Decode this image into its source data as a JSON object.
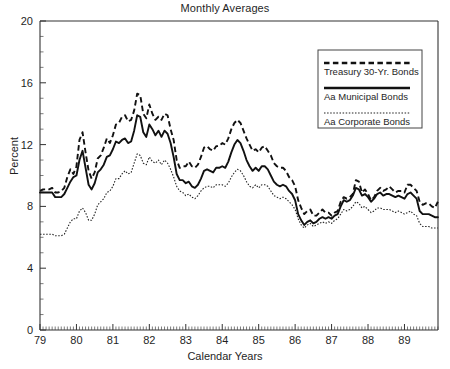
{
  "chart_data": {
    "type": "line",
    "title": "Monthly Averages",
    "xlabel": "Calendar Years",
    "ylabel": "Percent",
    "ylim": [
      0,
      20
    ],
    "yticks": [
      0,
      4,
      8,
      12,
      16,
      20
    ],
    "ytick_labels": [
      "0",
      "4",
      "8",
      "12",
      "16",
      "20"
    ],
    "xlim": [
      1979.0,
      1989.92
    ],
    "xticks": [
      1979,
      1980,
      1981,
      1982,
      1983,
      1984,
      1985,
      1986,
      1987,
      1988,
      1989
    ],
    "xtick_labels": [
      "79",
      "80",
      "81",
      "82",
      "83",
      "84",
      "85",
      "86",
      "87",
      "88",
      "89"
    ],
    "minor_ticks": "monthly",
    "grid": false,
    "legend_position": "upper-right",
    "series": [
      {
        "name": "Treasury 30-Yr. Bonds",
        "style": "dashed",
        "color": "#111111",
        "values": [
          9.0,
          9.1,
          9.1,
          9.1,
          9.2,
          8.9,
          8.9,
          9.0,
          9.2,
          9.9,
          10.4,
          10.1,
          10.6,
          12.3,
          12.8,
          11.5,
          10.3,
          9.8,
          10.2,
          11.1,
          11.3,
          11.8,
          12.4,
          12.1,
          12.6,
          13.3,
          13.4,
          13.8,
          13.9,
          13.5,
          13.6,
          14.2,
          15.3,
          15.2,
          14.0,
          13.7,
          14.6,
          14.0,
          13.6,
          13.8,
          13.6,
          14.0,
          13.9,
          13.0,
          12.3,
          11.0,
          10.5,
          10.6,
          10.6,
          10.9,
          10.6,
          10.5,
          10.7,
          11.2,
          11.8,
          11.9,
          11.7,
          11.6,
          11.9,
          11.9,
          12.1,
          12.0,
          12.4,
          13.0,
          13.4,
          13.6,
          13.4,
          12.9,
          12.4,
          12.0,
          11.6,
          11.7,
          11.5,
          11.8,
          11.9,
          11.6,
          11.3,
          10.8,
          10.6,
          10.5,
          10.5,
          10.3,
          9.9,
          9.7,
          9.3,
          8.4,
          7.9,
          7.5,
          7.7,
          7.8,
          7.4,
          7.4,
          7.6,
          7.8,
          7.6,
          7.6,
          7.4,
          7.6,
          7.7,
          8.3,
          8.6,
          8.5,
          8.6,
          8.8,
          9.7,
          9.6,
          8.9,
          9.1,
          8.8,
          8.4,
          8.6,
          9.0,
          9.2,
          9.0,
          9.1,
          9.3,
          9.1,
          8.9,
          9.0,
          9.0,
          8.9,
          9.4,
          9.4,
          9.2,
          9.0,
          8.3,
          8.1,
          8.2,
          8.2,
          8.0,
          7.9,
          8.3
        ]
      },
      {
        "name": "Aa Municipal Bonds",
        "style": "solid",
        "color": "#111111",
        "values": [
          8.9,
          8.9,
          8.9,
          8.9,
          8.9,
          8.6,
          8.6,
          8.6,
          8.8,
          9.2,
          9.6,
          9.9,
          10.0,
          11.0,
          11.6,
          10.5,
          9.4,
          9.1,
          9.5,
          10.2,
          10.4,
          10.7,
          11.2,
          11.3,
          11.7,
          12.2,
          12.1,
          12.3,
          12.4,
          12.1,
          12.2,
          12.9,
          13.9,
          13.8,
          12.8,
          12.5,
          13.3,
          13.0,
          12.6,
          12.9,
          12.5,
          12.9,
          12.7,
          12.1,
          11.2,
          10.1,
          9.7,
          9.7,
          9.5,
          9.6,
          9.3,
          9.2,
          9.4,
          9.8,
          10.3,
          10.4,
          10.3,
          10.2,
          10.5,
          10.5,
          10.6,
          10.5,
          10.9,
          11.5,
          12.0,
          12.3,
          12.1,
          11.6,
          11.0,
          10.6,
          10.3,
          10.5,
          10.3,
          10.6,
          10.6,
          10.4,
          10.0,
          9.6,
          9.4,
          9.3,
          9.4,
          9.3,
          9.0,
          8.8,
          8.4,
          7.5,
          7.1,
          6.8,
          7.0,
          7.1,
          6.9,
          7.0,
          7.2,
          7.3,
          7.2,
          7.3,
          7.2,
          7.4,
          7.5,
          8.0,
          8.4,
          8.3,
          8.4,
          8.7,
          9.2,
          9.1,
          8.7,
          8.8,
          8.6,
          8.3,
          8.5,
          8.8,
          8.9,
          8.7,
          8.8,
          8.8,
          8.7,
          8.6,
          8.7,
          8.6,
          8.5,
          8.8,
          8.9,
          8.7,
          8.5,
          7.7,
          7.5,
          7.5,
          7.5,
          7.4,
          7.3,
          7.3
        ]
      },
      {
        "name": "Aa Corporate Bonds",
        "style": "dotted",
        "color": "#222222",
        "values": [
          6.2,
          6.2,
          6.2,
          6.2,
          6.2,
          6.1,
          6.1,
          6.1,
          6.2,
          6.6,
          7.0,
          7.2,
          7.2,
          7.7,
          7.9,
          7.6,
          7.1,
          7.1,
          7.5,
          8.1,
          8.3,
          8.5,
          8.9,
          9.0,
          9.3,
          9.8,
          9.8,
          10.1,
          10.3,
          10.1,
          10.2,
          10.8,
          11.4,
          11.3,
          10.8,
          10.7,
          11.2,
          10.9,
          10.8,
          11.0,
          10.7,
          11.0,
          10.8,
          10.4,
          9.9,
          9.3,
          9.0,
          8.9,
          8.7,
          8.8,
          8.6,
          8.5,
          8.7,
          9.0,
          9.2,
          9.3,
          9.3,
          9.2,
          9.4,
          9.4,
          9.4,
          9.3,
          9.5,
          9.9,
          10.2,
          10.4,
          10.3,
          10.0,
          9.6,
          9.3,
          9.2,
          9.4,
          9.2,
          9.4,
          9.4,
          9.3,
          9.0,
          8.7,
          8.6,
          8.5,
          8.6,
          8.5,
          8.3,
          8.1,
          7.8,
          7.2,
          6.8,
          6.6,
          6.8,
          6.9,
          6.7,
          6.8,
          6.9,
          7.0,
          6.9,
          7.0,
          6.9,
          7.1,
          7.2,
          7.5,
          7.8,
          7.7,
          7.8,
          8.0,
          8.3,
          8.2,
          7.9,
          8.0,
          7.8,
          7.6,
          7.7,
          7.9,
          7.9,
          7.8,
          7.8,
          7.8,
          7.7,
          7.6,
          7.7,
          7.6,
          7.5,
          7.6,
          7.7,
          7.5,
          7.4,
          6.9,
          6.7,
          6.7,
          6.7,
          6.6,
          6.6,
          6.6
        ]
      }
    ]
  },
  "legend": {
    "items": [
      {
        "label": "Treasury 30-Yr. Bonds",
        "style": "dashed"
      },
      {
        "label": "Aa Municipal Bonds",
        "style": "solid"
      },
      {
        "label": "Aa Corporate Bonds",
        "style": "dotted"
      }
    ]
  }
}
